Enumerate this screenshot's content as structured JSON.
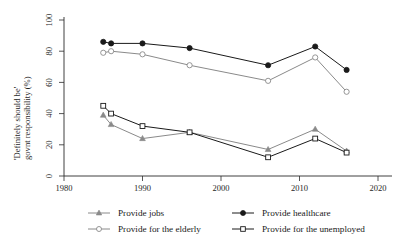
{
  "chart_data": {
    "type": "line",
    "title": "",
    "subtitle": "",
    "xlabel": "",
    "ylabel": "'Definitely should be' govnt responsibility (%)",
    "ylabel_line1": "'Definitely should be'",
    "ylabel_line2": "govnt responsibility (%)",
    "xlim": [
      1980,
      2020
    ],
    "ylim": [
      0,
      100
    ],
    "xticks": [
      1980,
      1990,
      2000,
      2010,
      2020
    ],
    "yticks": [
      0,
      20,
      40,
      60,
      80,
      100
    ],
    "xtick_labels": [
      "1980",
      "1990",
      "2000",
      "2010",
      "2020"
    ],
    "ytick_labels": [
      "0",
      "20",
      "40",
      "60",
      "80",
      "100"
    ],
    "grid": false,
    "legend_position": "bottom",
    "series": [
      {
        "name": "Provide jobs",
        "marker": "triangle-filled",
        "color": "#8a8a8a",
        "x": [
          1985,
          1986,
          1990,
          1996,
          2006,
          2012,
          2016
        ],
        "values": [
          39,
          33,
          24,
          28,
          17,
          30,
          16
        ]
      },
      {
        "name": "Provide healthcare",
        "marker": "circle-filled",
        "color": "#1a1a1a",
        "x": [
          1985,
          1986,
          1990,
          1996,
          2006,
          2012,
          2016
        ],
        "values": [
          86,
          85,
          85,
          82,
          71,
          83,
          68
        ]
      },
      {
        "name": "Provide for the elderly",
        "marker": "circle-open",
        "color": "#8a8a8a",
        "x": [
          1985,
          1986,
          1990,
          1996,
          2006,
          2012,
          2016
        ],
        "values": [
          79,
          80,
          78,
          71,
          61,
          76,
          54
        ]
      },
      {
        "name": "Provide for the unemployed",
        "marker": "square-open",
        "color": "#1a1a1a",
        "x": [
          1985,
          1986,
          1990,
          1996,
          2006,
          2012,
          2016
        ],
        "values": [
          45,
          40,
          32,
          28,
          12,
          24,
          15
        ]
      }
    ],
    "legend": [
      {
        "label": "Provide jobs",
        "marker": "triangle-filled",
        "color": "#8a8a8a"
      },
      {
        "label": "Provide healthcare",
        "marker": "circle-filled",
        "color": "#1a1a1a"
      },
      {
        "label": "Provide for the elderly",
        "marker": "circle-open",
        "color": "#8a8a8a"
      },
      {
        "label": "Provide for the unemployed",
        "marker": "square-open",
        "color": "#1a1a1a"
      }
    ]
  }
}
